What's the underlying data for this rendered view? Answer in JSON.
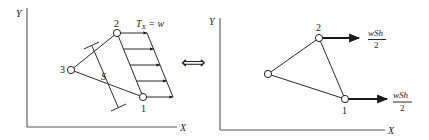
{
  "left_panel": {
    "axes": {
      "y_label": "Y",
      "x_label": "X"
    },
    "nodes": [
      {
        "id": "1",
        "label": "1"
      },
      {
        "id": "2",
        "label": "2"
      },
      {
        "id": "3",
        "label": "3"
      }
    ],
    "traction_label": {
      "main": "T",
      "sub": "X",
      "rest": " = w"
    },
    "dimension_label": "S",
    "traction_arrow_count": 5
  },
  "equivalence_symbol": "⟺",
  "right_panel": {
    "axes": {
      "y_label": "Y",
      "x_label": "X"
    },
    "nodes": [
      {
        "id": "1",
        "label": "1"
      },
      {
        "id": "2",
        "label": "2"
      },
      {
        "id": "3",
        "label": ""
      }
    ],
    "force_at_node_2": {
      "numerator": "wSh",
      "denominator": "2"
    },
    "force_at_node_1": {
      "numerator": "wSh",
      "denominator": "2"
    }
  },
  "colors": {
    "line": "#2a2a2a",
    "axis": "#555555",
    "background": "#ffffff"
  }
}
